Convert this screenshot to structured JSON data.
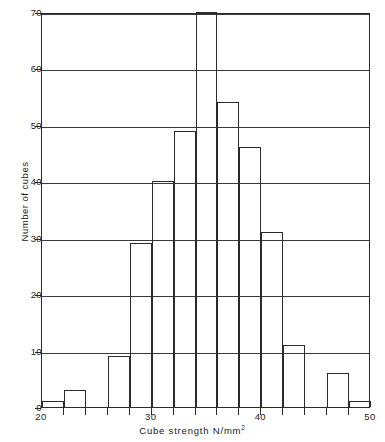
{
  "chart_data": {
    "type": "bar",
    "title": "",
    "subtitle": "",
    "xlabel": "Cube  strength  N/mm",
    "xlabel_superscript": "2",
    "ylabel": "Number of cubes",
    "xlim": [
      20,
      50
    ],
    "ylim": [
      0,
      70
    ],
    "bin_width": 2,
    "grid": true,
    "legend": null,
    "xticks": [
      20,
      22,
      24,
      26,
      28,
      30,
      32,
      34,
      36,
      38,
      40,
      42,
      44,
      46,
      48,
      50
    ],
    "xtick_labels": [
      "20",
      "",
      "",
      "",
      "",
      "30",
      "",
      "",
      "",
      "",
      "40",
      "",
      "",
      "",
      "",
      "50"
    ],
    "yticks": [
      0,
      10,
      20,
      30,
      40,
      50,
      60,
      70
    ],
    "ytick_labels": [
      "0",
      "10",
      "20",
      "30",
      "40",
      "50",
      "60",
      "70"
    ],
    "bin_edges": [
      20,
      22,
      24,
      26,
      28,
      30,
      32,
      34,
      36,
      38,
      40,
      42,
      44,
      46,
      48,
      50
    ],
    "categories": [
      "20-22",
      "22-24",
      "24-26",
      "26-28",
      "28-30",
      "30-32",
      "32-34",
      "34-36",
      "36-38",
      "38-40",
      "40-42",
      "42-44",
      "44-46",
      "46-48",
      "48-50"
    ],
    "values": [
      1,
      3,
      0,
      9,
      29,
      40,
      49,
      70,
      54,
      46,
      31,
      11,
      0,
      6,
      1
    ],
    "colors": {
      "bar_stroke": "#2b2b2b",
      "bar_fill": "transparent",
      "grid": "#3a3a3a",
      "axis": "#2b2b2b",
      "text": "#1a1a1a",
      "background": "#ffffff"
    }
  }
}
